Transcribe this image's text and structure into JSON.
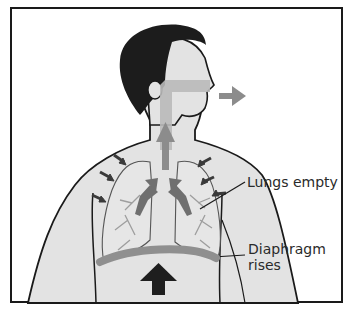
{
  "diagram": {
    "labels": {
      "lungs": "Lungs empty",
      "diaphragm_line1": "Diaphragm",
      "diaphragm_line2": "rises"
    },
    "colors": {
      "frame": "#1a1a1a",
      "skin": "#e3e3e3",
      "hair": "#1c1c1c",
      "airway": "#b9b9b9",
      "arrow_air": "#8c8c8c",
      "arrow_compress": "#3a3a3a",
      "diaphragm": "#8f8f8f",
      "arrow_diaphragm": "#1e1e1e"
    }
  }
}
